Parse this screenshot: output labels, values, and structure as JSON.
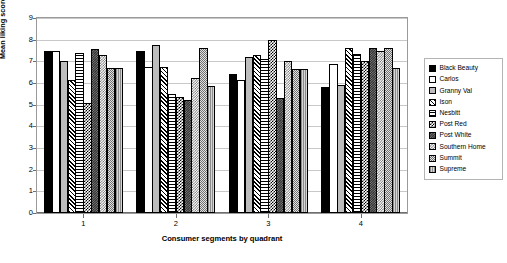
{
  "chart_data": {
    "type": "bar",
    "title": "",
    "xlabel": "Consumer segments by quadrant",
    "ylabel": "Mean liking scores",
    "categories": [
      "1",
      "2",
      "3",
      "4"
    ],
    "ylim": [
      0,
      9
    ],
    "ytick_labels": [
      "0",
      "1",
      "2",
      "3",
      "4",
      "5",
      "6",
      "7",
      "8",
      "9"
    ],
    "grid": true,
    "legend_position": "right",
    "series": [
      {
        "name": "Black Beauty",
        "pattern": "solid-black",
        "values": [
          7.5,
          7.5,
          6.4,
          5.8
        ]
      },
      {
        "name": "Carlos",
        "pattern": "solid-white",
        "values": [
          7.5,
          6.75,
          6.15,
          6.9
        ]
      },
      {
        "name": "Granny Val",
        "pattern": "solid-light-grey",
        "values": [
          7.0,
          7.75,
          7.2,
          5.9
        ]
      },
      {
        "name": "Ison",
        "pattern": "diagonal-hatch",
        "values": [
          6.15,
          6.75,
          7.3,
          7.6
        ]
      },
      {
        "name": "Nesbitt",
        "pattern": "horizontal-lines",
        "values": [
          7.4,
          5.5,
          7.1,
          7.35
        ]
      },
      {
        "name": "Post Red",
        "pattern": "checkerboard",
        "values": [
          5.1,
          5.35,
          8.0,
          7.0
        ]
      },
      {
        "name": "Post White",
        "pattern": "dark-speckle",
        "values": [
          7.55,
          5.2,
          5.3,
          7.6
        ]
      },
      {
        "name": "Southern Home",
        "pattern": "light-checkerboard",
        "values": [
          7.3,
          6.25,
          7.0,
          7.5
        ]
      },
      {
        "name": "Summit",
        "pattern": "grey-stipple",
        "values": [
          6.7,
          7.6,
          6.65,
          7.6
        ]
      },
      {
        "name": "Supreme",
        "pattern": "grey-vertical",
        "values": [
          6.7,
          5.85,
          6.65,
          6.7
        ]
      }
    ]
  }
}
